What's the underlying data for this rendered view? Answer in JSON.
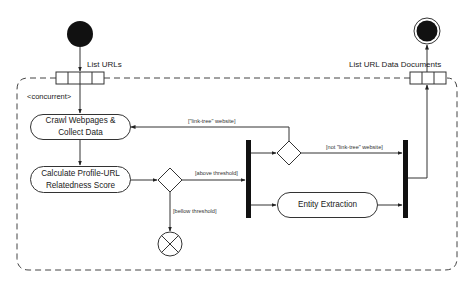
{
  "diagram": {
    "type": "UML activity diagram",
    "region": {
      "stereotype": "<concurrent>",
      "style": "dashed expansion region"
    },
    "input_pin": {
      "label": "List URLs",
      "slots": 4
    },
    "output_pin": {
      "label": "List URL Data Documents",
      "slots": 3
    },
    "activities": [
      {
        "id": "crawl",
        "label_line1": "Crawl Webpages &",
        "label_line2": "Collect Data"
      },
      {
        "id": "calc",
        "label_line1": "Calculate Profile-URL",
        "label_line2": "Relatedness Score"
      },
      {
        "id": "entity",
        "label": "Entity Extraction"
      }
    ],
    "guards": {
      "above": "[above threshold]",
      "below": "[bellow threshold]",
      "linktree": "[\"link-tree\" website]",
      "not_linktree": "[not \"link-tree\" website]"
    },
    "nodes": {
      "initial": "initial-node",
      "final": "activity-final-node",
      "flow_final": "flow-final-node",
      "fork": "fork-bar",
      "join": "join-bar",
      "decision_threshold": "decision-node",
      "decision_linktree": "decision-node"
    },
    "colors": {
      "stroke": "#333333",
      "fill": "#111111",
      "background": "#ffffff"
    }
  }
}
